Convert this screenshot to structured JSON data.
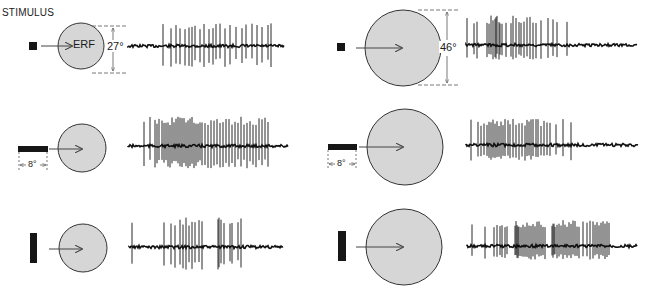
{
  "figure": {
    "title": "STIMULUS",
    "erf_label": "ERF",
    "colors": {
      "circle_fill": "#d6d6d6",
      "circle_stroke": "#333333",
      "stimulus": "#161616",
      "trace": "#111111",
      "arrow": "#444444",
      "dim_line": "#555555"
    },
    "dimensions": {
      "small_erf_diameter": "27°",
      "large_erf_diameter": "46°",
      "bar_length": "8°"
    },
    "panels": [
      {
        "id": "small-square",
        "erf_size": "small",
        "stimulus_shape": "small square",
        "cx": 81,
        "cy": 46,
        "r": 23,
        "trace": {
          "x0": 128,
          "x1": 284,
          "y": 46,
          "spikes": [
            163,
            171,
            176,
            180,
            185,
            189,
            192,
            195,
            200,
            204,
            209,
            213,
            216,
            220,
            225,
            230,
            236,
            242,
            246,
            252,
            257,
            262,
            268,
            271
          ],
          "amp_up": 22,
          "amp_down": 20
        }
      },
      {
        "id": "small-hbar",
        "erf_size": "small",
        "stimulus_shape": "horizontal bar",
        "cx": 82,
        "cy": 148,
        "r": 24,
        "trace": {
          "x0": 128,
          "x1": 288,
          "y": 146,
          "spikes": [
            144,
            150,
            155,
            157,
            159,
            162,
            164,
            166,
            168,
            170,
            172,
            174,
            176,
            178,
            180,
            182,
            184,
            186,
            188,
            190,
            192,
            194,
            196,
            198,
            200,
            202,
            205,
            208,
            211,
            214,
            217,
            220,
            223,
            226,
            229,
            232,
            235,
            238,
            241,
            244,
            247,
            250,
            253,
            256,
            259,
            262,
            265,
            268
          ],
          "amp_up": 28,
          "amp_down": 22
        }
      },
      {
        "id": "small-vbar",
        "erf_size": "small",
        "stimulus_shape": "vertical bar",
        "cx": 83,
        "cy": 248,
        "r": 24,
        "trace": {
          "x0": 129,
          "x1": 283,
          "y": 247,
          "spikes": [
            132,
            164,
            171,
            175,
            180,
            183,
            186,
            189,
            192,
            195,
            199,
            202,
            218,
            219,
            221,
            224,
            230,
            232,
            238,
            241
          ],
          "amp_up": 28,
          "amp_down": 22
        }
      },
      {
        "id": "large-square",
        "erf_size": "large",
        "stimulus_shape": "small square",
        "cx": 403,
        "cy": 48,
        "r": 38,
        "trace": {
          "x0": 466,
          "x1": 637,
          "y": 45,
          "spikes": [
            467,
            474,
            477,
            487,
            489,
            491,
            493,
            495,
            496,
            497,
            499,
            500,
            502,
            506,
            511,
            513,
            516,
            519,
            521,
            524,
            527,
            530,
            533,
            536,
            541,
            548,
            553,
            557,
            567
          ],
          "amp_up": 28,
          "amp_down": 14
        }
      },
      {
        "id": "large-hbar",
        "erf_size": "large",
        "stimulus_shape": "horizontal bar",
        "cx": 405,
        "cy": 147,
        "r": 38,
        "trace": {
          "x0": 466,
          "x1": 638,
          "y": 145,
          "spikes": [
            471,
            478,
            481,
            484,
            487,
            489,
            491,
            493,
            495,
            497,
            499,
            501,
            503,
            505,
            508,
            510,
            513,
            516,
            519,
            522,
            525,
            527,
            529,
            531,
            533,
            536,
            538,
            541,
            544,
            547,
            550,
            556,
            563,
            571
          ],
          "amp_up": 25,
          "amp_down": 15
        }
      },
      {
        "id": "large-vbar",
        "erf_size": "large",
        "stimulus_shape": "vertical bar",
        "cx": 404,
        "cy": 247,
        "r": 38,
        "trace": {
          "x0": 467,
          "x1": 637,
          "y": 246,
          "spikes": [
            472,
            485,
            494,
            497,
            500,
            502,
            505,
            507,
            515,
            516,
            517,
            518,
            519,
            521,
            523,
            525,
            527,
            529,
            531,
            533,
            535,
            537,
            539,
            541,
            543,
            545,
            552,
            553,
            554,
            555,
            557,
            559,
            561,
            563,
            565,
            567,
            569,
            571,
            573,
            575,
            577,
            579,
            583,
            587,
            590,
            593,
            595,
            597,
            599,
            601,
            603,
            605,
            607,
            609
          ],
          "amp_up": 25,
          "amp_down": 13
        }
      }
    ]
  }
}
